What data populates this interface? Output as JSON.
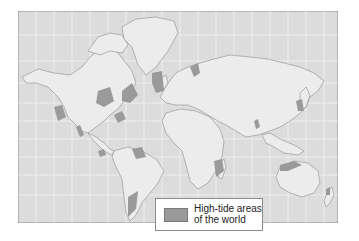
{
  "map": {
    "title": "",
    "colors": {
      "ocean": "#dcdcdc",
      "land": "#ececec",
      "grid": "#f4f4f4",
      "coast": "#9a9a9a",
      "high_tide": "#9a9a9a",
      "frame": "#8a8a8a"
    },
    "legend": {
      "label_line1": "High-tide areas",
      "label_line2": "of the world"
    },
    "high_tide_regions": [
      "Gulf of Alaska",
      "Hudson Bay",
      "Labrador / Baffin",
      "Bay of Fundy",
      "Gulf of California",
      "Panama Pacific coast",
      "Amazon mouth",
      "Patagonia",
      "British Isles / English Channel",
      "White Sea",
      "Madagascar / Mozambique Channel",
      "Gulf of Khambhat",
      "Korea / Yellow Sea",
      "Northern Australia",
      "New Zealand"
    ]
  }
}
